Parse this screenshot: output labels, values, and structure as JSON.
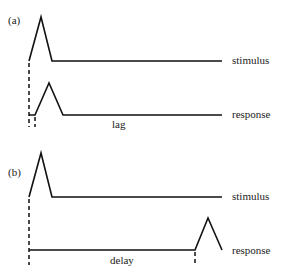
{
  "panels": [
    {
      "id": "a",
      "label": "(a)",
      "stimulus_label": "stimulus",
      "response_label": "response",
      "interval_label": "lag"
    },
    {
      "id": "b",
      "label": "(b)",
      "stimulus_label": "stimulus",
      "response_label": "response",
      "interval_label": "delay"
    }
  ],
  "colors": {
    "line": "#111111",
    "background": "#ffffff"
  }
}
